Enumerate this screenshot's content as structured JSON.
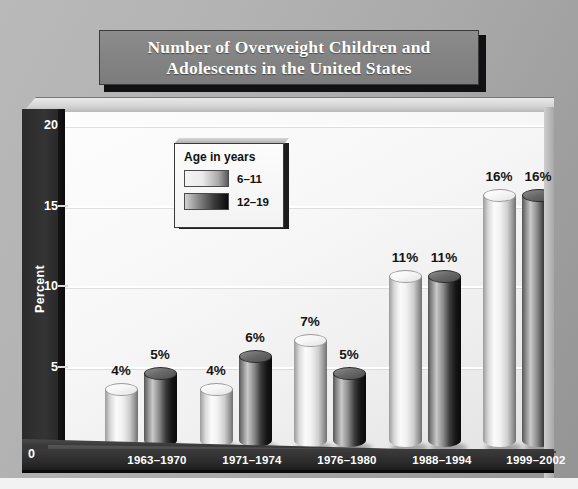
{
  "title": {
    "line1": "Number of Overweight Children and",
    "line2": "Adolescents in the United States",
    "full": "Number of Overweight Children and Adolescents in the United States"
  },
  "legend": {
    "title": "Age in years",
    "items": [
      {
        "label": "6–11",
        "style": "light"
      },
      {
        "label": "12–19",
        "style": "dark"
      }
    ]
  },
  "axis": {
    "y_title": "Percent",
    "y_ticks": [
      "0",
      "5",
      "10",
      "15",
      "20"
    ],
    "zero_label": "0"
  },
  "colors": {
    "background": "#aaaaaa",
    "plot_background": "#f7f7f7",
    "wall_dark": "#2e2e2e",
    "floor": "#2c2c2c",
    "title_banner": "#848484",
    "title_text": "#ffffff",
    "value_text": "#141414",
    "series_light": "#ededed",
    "series_dark": "#1a1a1a"
  },
  "chart_data": {
    "type": "bar",
    "title": "Number of Overweight Children and Adolescents in the United States",
    "xlabel": "",
    "ylabel": "Percent",
    "ylim": [
      0,
      20
    ],
    "yticks": [
      0,
      5,
      10,
      15,
      20
    ],
    "grid": true,
    "legend_position": "upper-left-inside",
    "legend_title": "Age in years",
    "categories": [
      "1963–1970",
      "1971–1974",
      "1976–1980",
      "1988–1994",
      "1999–2002"
    ],
    "series": [
      {
        "name": "6–11",
        "values": [
          4,
          4,
          7,
          11,
          16
        ],
        "labels": [
          "4%",
          "4%",
          "7%",
          "11%",
          "16%"
        ]
      },
      {
        "name": "12–19",
        "values": [
          5,
          6,
          5,
          11,
          16
        ],
        "labels": [
          "5%",
          "6%",
          "5%",
          "11%",
          "16%"
        ]
      }
    ],
    "value_suffix": "%"
  },
  "bars": [
    {
      "cat": 0,
      "series": 0,
      "value": 4,
      "label": "4%",
      "x": 83,
      "style": "light"
    },
    {
      "cat": 0,
      "series": 1,
      "value": 5,
      "label": "5%",
      "x": 122,
      "style": "dark"
    },
    {
      "cat": 1,
      "series": 0,
      "value": 4,
      "label": "4%",
      "x": 178,
      "style": "light"
    },
    {
      "cat": 1,
      "series": 1,
      "value": 6,
      "label": "6%",
      "x": 217,
      "style": "dark"
    },
    {
      "cat": 2,
      "series": 0,
      "value": 7,
      "label": "7%",
      "x": 272,
      "style": "light"
    },
    {
      "cat": 2,
      "series": 1,
      "value": 5,
      "label": "5%",
      "x": 311,
      "style": "dark"
    },
    {
      "cat": 3,
      "series": 0,
      "value": 11,
      "label": "11%",
      "x": 367,
      "style": "light"
    },
    {
      "cat": 3,
      "series": 1,
      "value": 11,
      "label": "11%",
      "x": 406,
      "style": "dark"
    },
    {
      "cat": 4,
      "series": 0,
      "value": 16,
      "label": "16%",
      "x": 461,
      "style": "light"
    },
    {
      "cat": 4,
      "series": 1,
      "value": 16,
      "label": "16%",
      "x": 500,
      "style": "dark"
    }
  ],
  "xtick_positions": [
    135,
    230,
    325,
    420,
    514
  ]
}
